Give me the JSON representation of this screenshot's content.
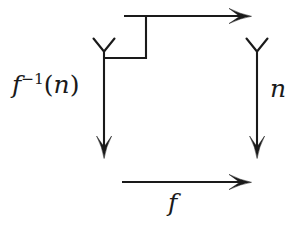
{
  "figure": {
    "type": "commutative-diagram",
    "title": "",
    "background_color": "#ffffff",
    "stroke_color": "#1a1a1a",
    "width": 304,
    "height": 232
  },
  "labels": {
    "left_label_base": "f",
    "left_label_exponent": "−1",
    "left_label_open_paren": "(",
    "left_label_argument": "n",
    "left_label_close_paren": ")",
    "left_label_plain": "f^{-1}(n)",
    "right_label": "n",
    "bottom_label": "f",
    "top_label": ""
  },
  "arrows": [
    {
      "name": "top-arrow",
      "label": "",
      "direction": "right",
      "head": "tex-sweep",
      "tail": "plain",
      "from": [
        124,
        16
      ],
      "to": [
        250,
        16
      ]
    },
    {
      "name": "left-arrow",
      "label": "f^{-1}(n)",
      "direction": "down",
      "head": "solid-triangle",
      "tail": "fork",
      "from": [
        104,
        38
      ],
      "to": [
        104,
        158
      ]
    },
    {
      "name": "right-arrow",
      "label": "n",
      "direction": "down",
      "head": "solid-triangle",
      "tail": "fork",
      "from": [
        257,
        38
      ],
      "to": [
        257,
        158
      ]
    },
    {
      "name": "bottom-arrow",
      "label": "f",
      "direction": "right",
      "head": "tex-sweep",
      "tail": "plain",
      "from": [
        122,
        182
      ],
      "to": [
        250,
        182
      ]
    }
  ],
  "connector": {
    "name": "corner-connector",
    "description": "elbow joining left vertical line to start of top arrow",
    "points": [
      [
        104,
        58
      ],
      [
        146,
        58
      ],
      [
        146,
        16
      ]
    ]
  }
}
